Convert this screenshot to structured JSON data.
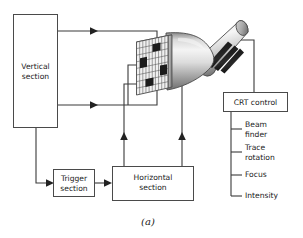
{
  "figure": {
    "caption": "(a)"
  },
  "blocks": {
    "vertical_section": {
      "line1": "Vertical",
      "line2": "section"
    },
    "trigger_section": {
      "line1": "Trigger",
      "line2": "section"
    },
    "horizontal_section": {
      "line1": "Horizontal",
      "line2": "section"
    },
    "crt_control": {
      "line1": "CRT control"
    }
  },
  "crt_controls_list": [
    {
      "line1": "Beam",
      "line2": "finder"
    },
    {
      "line1": "Trace",
      "line2": "rotation"
    },
    {
      "line1": "Focus",
      "line2": ""
    },
    {
      "line1": "Intensity",
      "line2": ""
    }
  ],
  "crt": {
    "name": "cathode-ray-tube",
    "screen_label": "graticule-screen",
    "deflection_plates": [
      "top-plate",
      "left-plate",
      "right-plate",
      "bottom-plate"
    ],
    "neck_bands": 3
  },
  "colors": {
    "background": "#ffffff",
    "line": "#3a3a3a",
    "box_stroke": "#4a4a4a",
    "text": "#1a1a1a",
    "plate_fill": "#1c1c1c",
    "tube_light": "#f2f2f2",
    "tube_mid": "#c9c9c9",
    "tube_dark": "#6e6e6e",
    "grid_line": "#555555"
  }
}
